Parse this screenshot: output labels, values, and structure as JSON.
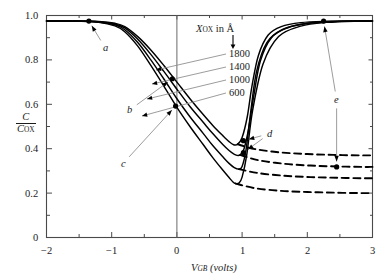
{
  "chart_data": {
    "type": "line",
    "title": "",
    "xlabel": "V_GB (volts)",
    "ylabel": "C / C_OX",
    "xlim": [
      -2,
      3
    ],
    "ylim": [
      0,
      1.0
    ],
    "xticks": [
      -2,
      -1,
      0,
      1,
      2,
      3
    ],
    "xticklabels": [
      "-2",
      "-1",
      "0",
      "1",
      "2",
      "3"
    ],
    "xminorticks": [
      -1.5,
      -0.5,
      0.5,
      1.5,
      2.5
    ],
    "yticks": [
      0,
      0.2,
      0.4,
      0.6,
      0.8,
      1.0
    ],
    "yticklabels": [
      "0",
      "0.2",
      "0.4",
      "0.6",
      "0.8",
      "1.0"
    ],
    "yminorticks": [
      0.1,
      0.3,
      0.5,
      0.7,
      0.9
    ],
    "grid": false,
    "legend_position": "inside-upper-right",
    "legend_title": "XOX in Å",
    "series": [
      {
        "name": "1800",
        "style": "solid",
        "label_value": 1800,
        "x": [
          -2.0,
          -1.6,
          -1.2,
          -0.95,
          -0.8,
          -0.6,
          -0.4,
          -0.2,
          0.0,
          0.2,
          0.4,
          0.55,
          0.7,
          0.8,
          0.87,
          0.93,
          1.0,
          1.08,
          1.15,
          1.25,
          1.4,
          1.6,
          1.9,
          2.3,
          2.7,
          3.0
        ],
        "y": [
          0.975,
          0.975,
          0.973,
          0.965,
          0.95,
          0.905,
          0.845,
          0.775,
          0.7,
          0.625,
          0.555,
          0.505,
          0.46,
          0.432,
          0.418,
          0.42,
          0.45,
          0.545,
          0.68,
          0.82,
          0.912,
          0.95,
          0.968,
          0.974,
          0.975,
          0.975
        ]
      },
      {
        "name": "1400",
        "style": "solid",
        "label_value": 1400,
        "x": [
          -2.0,
          -1.6,
          -1.2,
          -0.95,
          -0.8,
          -0.6,
          -0.4,
          -0.2,
          0.0,
          0.2,
          0.4,
          0.55,
          0.7,
          0.8,
          0.9,
          0.97,
          1.03,
          1.1,
          1.18,
          1.28,
          1.45,
          1.7,
          2.0,
          2.4,
          2.8,
          3.0
        ],
        "y": [
          0.975,
          0.975,
          0.972,
          0.962,
          0.944,
          0.893,
          0.825,
          0.748,
          0.668,
          0.59,
          0.52,
          0.468,
          0.42,
          0.392,
          0.372,
          0.372,
          0.4,
          0.49,
          0.64,
          0.795,
          0.9,
          0.945,
          0.965,
          0.973,
          0.975,
          0.975
        ]
      },
      {
        "name": "1000",
        "style": "solid",
        "label_value": 1000,
        "x": [
          -2.0,
          -1.6,
          -1.2,
          -0.95,
          -0.8,
          -0.6,
          -0.4,
          -0.2,
          0.0,
          0.2,
          0.4,
          0.55,
          0.7,
          0.8,
          0.88,
          0.95,
          1.0,
          1.06,
          1.13,
          1.22,
          1.38,
          1.62,
          1.95,
          2.35,
          2.8,
          3.0
        ],
        "y": [
          0.975,
          0.975,
          0.971,
          0.958,
          0.936,
          0.878,
          0.8,
          0.714,
          0.625,
          0.544,
          0.47,
          0.414,
          0.365,
          0.334,
          0.315,
          0.308,
          0.32,
          0.395,
          0.56,
          0.745,
          0.878,
          0.937,
          0.962,
          0.972,
          0.975,
          0.975
        ]
      },
      {
        "name": "600",
        "style": "solid",
        "label_value": 600,
        "x": [
          -2.0,
          -1.6,
          -1.2,
          -0.95,
          -0.8,
          -0.6,
          -0.4,
          -0.2,
          0.0,
          0.2,
          0.4,
          0.55,
          0.7,
          0.8,
          0.86,
          0.9,
          0.95,
          1.0,
          1.07,
          1.16,
          1.32,
          1.56,
          1.9,
          2.3,
          2.78,
          3.0
        ],
        "y": [
          0.975,
          0.975,
          0.969,
          0.953,
          0.927,
          0.862,
          0.775,
          0.682,
          0.586,
          0.5,
          0.42,
          0.36,
          0.305,
          0.27,
          0.25,
          0.243,
          0.245,
          0.272,
          0.37,
          0.57,
          0.78,
          0.905,
          0.952,
          0.969,
          0.975,
          0.975
        ]
      },
      {
        "name": "1800-deep-depletion",
        "style": "dashed",
        "x": [
          0.93,
          1.2,
          1.6,
          2.0,
          2.4,
          2.8,
          3.0
        ],
        "y": [
          0.42,
          0.398,
          0.383,
          0.376,
          0.372,
          0.37,
          0.37
        ]
      },
      {
        "name": "1400-deep-depletion",
        "style": "dashed",
        "x": [
          0.97,
          1.25,
          1.65,
          2.05,
          2.45,
          2.85,
          3.0
        ],
        "y": [
          0.372,
          0.348,
          0.332,
          0.324,
          0.32,
          0.318,
          0.318
        ]
      },
      {
        "name": "1000-deep-depletion",
        "style": "dashed",
        "x": [
          0.95,
          1.25,
          1.65,
          2.05,
          2.45,
          2.85,
          3.0
        ],
        "y": [
          0.308,
          0.29,
          0.278,
          0.272,
          0.269,
          0.267,
          0.267
        ]
      },
      {
        "name": "600-deep-depletion",
        "style": "dashed",
        "x": [
          0.9,
          1.2,
          1.6,
          2.0,
          2.4,
          2.8,
          3.0
        ],
        "y": [
          0.243,
          0.222,
          0.21,
          0.205,
          0.202,
          0.2,
          0.2
        ]
      }
    ],
    "annotations": [
      {
        "label": "a",
        "point_x": -1.35,
        "point_y": 0.975,
        "label_x": -1.1,
        "label_y": 0.855
      },
      {
        "label": "b",
        "point_x": -0.07,
        "point_y": 0.715,
        "label_x": -0.72,
        "label_y": 0.575
      },
      {
        "label": "c",
        "point_x": -0.02,
        "point_y": 0.592,
        "label_x": -0.82,
        "label_y": 0.335
      },
      {
        "label": "d",
        "point_x": 1.02,
        "point_y": 0.436,
        "label_x": 1.42,
        "label_y": 0.468
      },
      {
        "label": "d",
        "point_x": 1.02,
        "point_y": 0.382,
        "label_x": 1.42,
        "label_y": 0.468
      },
      {
        "label": "e",
        "point_x": 2.25,
        "point_y": 0.975,
        "label_x": 2.45,
        "label_y": 0.62
      },
      {
        "label": "e",
        "point_x": 2.45,
        "point_y": 0.318,
        "label_x": 2.45,
        "label_y": 0.62
      }
    ],
    "vertical_reference_line_x": 0,
    "series_label_arrow_note": "legend values point to their curves with leader lines"
  },
  "axes": {
    "x_axis_name": "V",
    "x_axis_sub": "GB",
    "x_axis_units": "(volts)",
    "y_axis_numerator": "C",
    "y_axis_denominator": "C",
    "y_axis_denominator_sub": "OX"
  },
  "legend": {
    "title_var": "X",
    "title_sub": "OX",
    "title_rest": " in Å",
    "items": [
      "1800",
      "1400",
      "1000",
      "600"
    ]
  },
  "tick_labels": {
    "x": [
      "-2",
      "-1",
      "0",
      "1",
      "2",
      "3"
    ],
    "y": [
      "0",
      "0.2",
      "0.4",
      "0.6",
      "0.8",
      "1.0"
    ]
  },
  "point_labels": [
    "a",
    "b",
    "c",
    "d",
    "e"
  ]
}
